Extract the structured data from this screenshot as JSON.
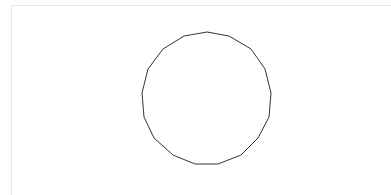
{
  "canvas": {
    "background": "#ffffff",
    "border_color": "#e6e6e6"
  },
  "shape": {
    "type": "polygon",
    "name": "circle-approximation",
    "sides": 17,
    "stroke": "#333333",
    "stroke_width": 1,
    "fill": "none",
    "points": [
      [
        207,
        32
      ],
      [
        229,
        36
      ],
      [
        251,
        49
      ],
      [
        265,
        69
      ],
      [
        271,
        93
      ],
      [
        269,
        117
      ],
      [
        258,
        138
      ],
      [
        241,
        155
      ],
      [
        218,
        164
      ],
      [
        195,
        164
      ],
      [
        173,
        155
      ],
      [
        154,
        138
      ],
      [
        144,
        117
      ],
      [
        142,
        93
      ],
      [
        148,
        69
      ],
      [
        163,
        49
      ],
      [
        184,
        36
      ]
    ]
  }
}
